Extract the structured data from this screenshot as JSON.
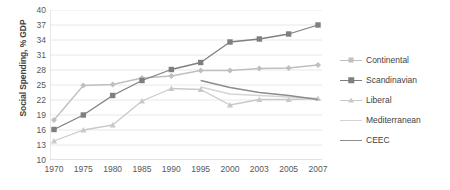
{
  "chart_data": {
    "type": "line",
    "title": "",
    "xlabel": "",
    "ylabel": "Social Spending, % GDP",
    "categories": [
      "1970",
      "1975",
      "1980",
      "1985",
      "1990",
      "1995",
      "2000",
      "2003",
      "2005",
      "2007"
    ],
    "ylim": [
      10,
      40
    ],
    "yticks": [
      10,
      13,
      16,
      19,
      22,
      25,
      28,
      31,
      34,
      37,
      40
    ],
    "grid": true,
    "legend_position": "right",
    "series": [
      {
        "name": "Continental",
        "color": "#bfbfbf",
        "marker": "diamond",
        "values": [
          18.0,
          24.9,
          25.1,
          26.4,
          26.8,
          27.9,
          27.9,
          28.3,
          28.4,
          29.0
        ]
      },
      {
        "name": "Scandinavian",
        "color": "#7f7f7f",
        "marker": "square",
        "values": [
          16.1,
          19.0,
          22.9,
          25.9,
          28.1,
          29.5,
          33.6,
          34.2,
          35.2,
          37.0
        ]
      },
      {
        "name": "Liberal",
        "color": "#c9c9c9",
        "marker": "triangle",
        "values": [
          13.8,
          16.0,
          17.0,
          21.8,
          24.3,
          24.1,
          21.0,
          22.1,
          22.1,
          22.3
        ]
      },
      {
        "name": "Mediterranean",
        "color": "#d4d4d4",
        "marker": "none",
        "values": [
          null,
          null,
          null,
          null,
          null,
          24.6,
          23.2,
          22.9,
          22.6,
          22.3
        ]
      },
      {
        "name": "CEEC",
        "color": "#8c8c8c",
        "marker": "none",
        "values": [
          null,
          null,
          null,
          null,
          null,
          25.9,
          24.5,
          23.5,
          22.9,
          22.1
        ]
      }
    ]
  }
}
